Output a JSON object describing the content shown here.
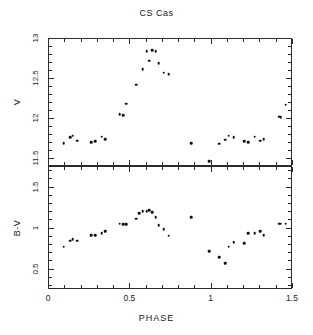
{
  "figure": {
    "title": "CS Cas",
    "xlabel": "PHASE",
    "panels": [
      {
        "ylabel": "V"
      },
      {
        "ylabel": "B-V"
      }
    ]
  },
  "axes": {
    "x_ticklabels": [
      "0",
      "0.5",
      "1",
      "1.5"
    ],
    "x_tickvalues": [
      0,
      0.5,
      1,
      1.5
    ],
    "v_ticklabels": [
      "11.5",
      "12",
      "12.5",
      "13"
    ],
    "v_tickvalues": [
      11.5,
      12,
      12.5,
      13
    ],
    "bv_ticklabels": [
      "0.5",
      "1",
      "1.5"
    ],
    "bv_tickvalues": [
      0.5,
      1.0,
      1.5
    ]
  },
  "colors": {
    "marker": "#111111",
    "axis": "#2b2b2b",
    "background": "#ffffff",
    "text": "#1a1a1a"
  },
  "chart_data": [
    {
      "type": "scatter",
      "title": "CS Cas",
      "xlabel": "PHASE",
      "ylabel": "V",
      "xlim": [
        0,
        1.5
      ],
      "ylim": [
        13.0,
        11.4
      ],
      "y_inverted": true,
      "grid": false,
      "legend": false,
      "x_major_ticks": [
        0,
        0.5,
        1,
        1.5
      ],
      "x_minor_tick_step": 0.1,
      "y_major_ticks": [
        11.5,
        12,
        12.5,
        13
      ],
      "series": [
        {
          "name": "V magnitude",
          "x": [
            0.09,
            0.13,
            0.145,
            0.175,
            0.26,
            0.285,
            0.325,
            0.345,
            0.435,
            0.455,
            0.475,
            0.535,
            0.575,
            0.6,
            0.615,
            0.635,
            0.655,
            0.675,
            0.705,
            0.735,
            0.875,
            0.985,
            1.045,
            1.085,
            1.105,
            1.135,
            1.2,
            1.225,
            1.265,
            1.3,
            1.32,
            1.415,
            1.425,
            1.455
          ],
          "y": [
            11.7,
            11.77,
            11.79,
            11.73,
            11.71,
            11.72,
            11.78,
            11.75,
            12.06,
            12.05,
            12.19,
            12.43,
            12.62,
            12.85,
            12.73,
            12.86,
            12.85,
            12.7,
            12.58,
            12.56,
            11.7,
            11.47,
            11.69,
            11.74,
            11.79,
            11.77,
            11.72,
            11.71,
            11.78,
            11.73,
            11.75,
            12.03,
            12.02,
            12.18
          ]
        }
      ]
    },
    {
      "type": "scatter",
      "title": "",
      "xlabel": "PHASE",
      "ylabel": "B-V",
      "xlim": [
        0,
        1.5
      ],
      "ylim": [
        1.75,
        0.25
      ],
      "y_inverted": true,
      "grid": false,
      "legend": false,
      "x_major_ticks": [
        0,
        0.5,
        1,
        1.5
      ],
      "x_minor_tick_step": 0.1,
      "y_major_ticks": [
        0.5,
        1.0,
        1.5
      ],
      "series": [
        {
          "name": "B-V color index",
          "x": [
            0.09,
            0.13,
            0.145,
            0.175,
            0.26,
            0.285,
            0.325,
            0.345,
            0.435,
            0.455,
            0.475,
            0.535,
            0.555,
            0.575,
            0.6,
            0.615,
            0.635,
            0.655,
            0.675,
            0.705,
            0.735,
            0.875,
            0.985,
            1.045,
            1.085,
            1.105,
            1.135,
            1.2,
            1.225,
            1.265,
            1.3,
            1.32,
            1.415,
            1.425,
            1.455
          ],
          "y": [
            0.78,
            0.85,
            0.87,
            0.85,
            0.92,
            0.92,
            0.94,
            0.97,
            1.06,
            1.05,
            1.05,
            1.12,
            1.19,
            1.21,
            1.21,
            1.22,
            1.2,
            1.14,
            1.04,
            0.99,
            0.91,
            1.14,
            0.72,
            0.65,
            0.58,
            0.78,
            0.83,
            0.82,
            0.94,
            0.94,
            0.97,
            0.92,
            1.06,
            1.06,
            1.06
          ]
        }
      ]
    }
  ]
}
